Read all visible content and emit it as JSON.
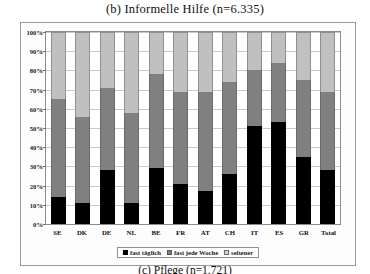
{
  "chart_data": {
    "type": "bar",
    "title": "(b) Informelle Hilfe (n=6.335)",
    "xlabel": "",
    "ylabel": "",
    "ylim": [
      0,
      100
    ],
    "stacked": true,
    "grid": true,
    "legend_position": "bottom",
    "categories": [
      "SE",
      "DK",
      "DE",
      "NL",
      "BE",
      "FR",
      "AT",
      "CH",
      "IT",
      "ES",
      "GR",
      "Total"
    ],
    "ytick_labels": [
      "100%",
      "90%",
      "80%",
      "70%",
      "60%",
      "50%",
      "40%",
      "30%",
      "20%",
      "10%",
      "0%"
    ],
    "ytick_values": [
      100,
      90,
      80,
      70,
      60,
      50,
      40,
      30,
      20,
      10,
      0
    ],
    "series": [
      {
        "name": "fast täglich",
        "color": "#000000",
        "values": [
          14,
          11,
          28,
          11,
          29,
          21,
          17,
          26,
          51,
          53,
          35,
          28
        ]
      },
      {
        "name": "fast jede Woche",
        "color": "#808080",
        "values": [
          51,
          45,
          43,
          47,
          49,
          48,
          52,
          48,
          29,
          31,
          40,
          41
        ]
      },
      {
        "name": "seltener",
        "color": "#c0c0c0",
        "values": [
          35,
          44,
          29,
          42,
          22,
          31,
          31,
          26,
          20,
          16,
          25,
          31
        ]
      }
    ],
    "cumulative_tops": {
      "fast_taeglich": [
        14,
        11,
        28,
        11,
        29,
        21,
        17,
        26,
        51,
        53,
        35,
        28
      ],
      "fast_jede_woche": [
        65,
        56,
        71,
        58,
        78,
        69,
        69,
        74,
        80,
        84,
        75,
        69
      ]
    }
  },
  "legend": {
    "items": [
      {
        "label": "fast täglich",
        "swatch": "black-square-icon"
      },
      {
        "label": "fast jede Woche",
        "swatch": "gray-square-icon"
      },
      {
        "label": "seltener",
        "swatch": "light-square-icon"
      }
    ]
  },
  "bottom_caption": "(c) Pflege (n=1.721)"
}
